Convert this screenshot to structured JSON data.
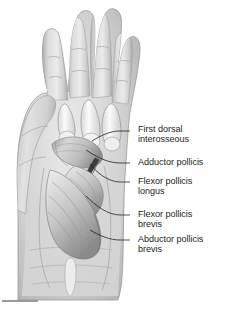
{
  "figure": {
    "background_color": "#ffffff",
    "text_color": "#231f20",
    "leader_color": "#1a1a1a"
  },
  "labels": [
    {
      "id": "first-dorsal-interosseous",
      "text": "First dorsal\ninterosseous",
      "x": 138,
      "y": 126,
      "dash_x": 130,
      "dash_y": 131
    },
    {
      "id": "adductor-pollicis",
      "text": "Adductor pollicis",
      "x": 138,
      "y": 158,
      "dash_x": 130,
      "dash_y": 163
    },
    {
      "id": "flexor-pollicis-longus",
      "text": "Flexor pollicis\nlongus",
      "x": 138,
      "y": 177,
      "dash_x": 130,
      "dash_y": 182
    },
    {
      "id": "flexor-pollicis-brevis",
      "text": "Flexor pollicis\nbrevis",
      "x": 138,
      "y": 210,
      "dash_x": 130,
      "dash_y": 215
    },
    {
      "id": "abductor-pollicis-brevis",
      "text": "Abductor pollicis\nbrevis",
      "x": 138,
      "y": 235,
      "dash_x": 130,
      "dash_y": 240
    }
  ],
  "anatomy": {
    "digits": [
      "index-finger",
      "middle-finger",
      "ring-finger",
      "little-finger"
    ],
    "thumb": "thumb",
    "palm": "palm",
    "wrist": "wrist",
    "structures": [
      "metacarpal-bones",
      "thenar-muscle-bellies",
      "flexor-tendons"
    ]
  },
  "rule": {
    "visible": true
  }
}
